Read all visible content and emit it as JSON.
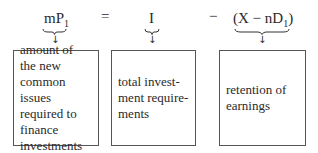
{
  "equation": {
    "lhs": {
      "main": "mP",
      "sub": "1"
    },
    "equals": "=",
    "term2": "I",
    "minus": "−",
    "term3": {
      "open": "(X − nD",
      "sub": "1",
      "close": ")"
    }
  },
  "arrows": {
    "glyph": "↓"
  },
  "boxes": [
    {
      "text": "amount of the new common issues required to finance investments"
    },
    {
      "text": "total invest- ment require- ments"
    },
    {
      "text": "retention of earnings"
    }
  ]
}
